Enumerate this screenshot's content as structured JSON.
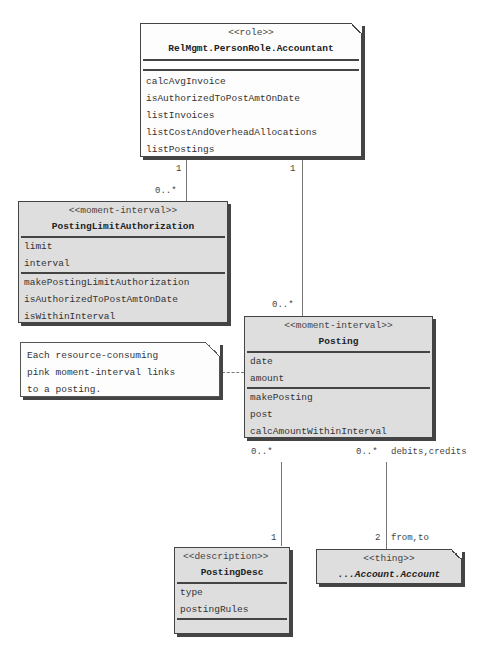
{
  "diagram": {
    "classes": {
      "accountant": {
        "stereotype": "<<role>>",
        "name": "RelMgmt.PersonRole.Accountant",
        "attributes": [],
        "operations": [
          "calcAvgInvoice",
          "isAuthorizedToPostAmtOnDate",
          "listInvoices",
          "listCostAndOverheadAllocations",
          "listPostings"
        ],
        "color": "#fdfdfd"
      },
      "posting_limit_authorization": {
        "stereotype": "<<moment-interval>>",
        "name": "PostingLimitAuthorization",
        "attributes": [
          "limit",
          "interval"
        ],
        "operations": [
          "makePostingLimitAuthorization",
          "isAuthorizedToPostAmtOnDate",
          "isWithinInterval"
        ],
        "color": "#dedede"
      },
      "posting": {
        "stereotype": "<<moment-interval>>",
        "name": "Posting",
        "attributes": [
          "date",
          "amount"
        ],
        "operations": [
          "makePosting",
          "post",
          "calcAmountWithinInterval"
        ],
        "color": "#dedede"
      },
      "posting_desc": {
        "stereotype": "<<description>>",
        "name": "PostingDesc",
        "attributes": [
          "type",
          "postingRules"
        ],
        "operations": [],
        "color": "#dedede"
      },
      "account": {
        "stereotype": "<<thing>>",
        "name": "...Account.Account",
        "color": "#dedede"
      }
    },
    "note": {
      "lines": [
        "Each resource-consuming",
        "pink moment-interval links",
        "to a posting."
      ]
    },
    "associations": {
      "accountant_pla": {
        "from_mult": "1",
        "to_mult": "0..*"
      },
      "accountant_posting": {
        "from_mult": "1",
        "to_mult": "0..*"
      },
      "posting_desc": {
        "from_mult": "0..*",
        "to_mult": "1"
      },
      "posting_account": {
        "from_mult": "0..*",
        "from_role": "debits,credits",
        "to_mult": "2",
        "to_role": "from,to"
      }
    }
  }
}
